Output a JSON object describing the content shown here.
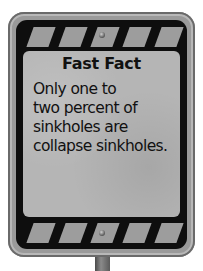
{
  "sign": {
    "title": "Fast Fact",
    "lines": [
      "Only one to",
      "two percent of",
      "sinkholes are",
      "collapse sinkholes."
    ]
  },
  "colors": {
    "frame": "#0e0e0e",
    "panel": "#b5b5b5",
    "stripes": "#9d9d9d",
    "text": "#111111"
  }
}
